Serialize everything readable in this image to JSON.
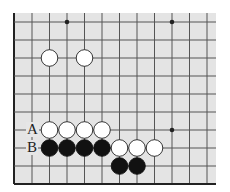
{
  "diagram": {
    "type": "go-board-fragment",
    "colors": {
      "board": "#e4e4e4",
      "line": "#555555",
      "edge": "#222222",
      "white_stone_fill": "#ffffff",
      "white_stone_stroke": "#222222",
      "black_stone": "#111111"
    },
    "grid": {
      "x_lines": [
        14,
        32,
        49.5,
        67,
        84.5,
        102,
        119.5,
        137,
        154.5,
        172,
        189.5,
        207
      ],
      "y_lines": [
        22,
        40,
        58,
        76,
        94,
        112,
        130,
        148,
        166,
        184
      ],
      "thick_edges": [
        "left",
        "bottom"
      ],
      "board_extent": {
        "x0": 14,
        "y0": 13,
        "x1": 216,
        "y1": 185
      }
    },
    "star_points": [
      {
        "x": 67,
        "y": 22
      },
      {
        "x": 172,
        "y": 22
      },
      {
        "x": 172,
        "y": 130
      }
    ],
    "stones": [
      {
        "color": "white",
        "x": 49.5,
        "y": 58
      },
      {
        "color": "white",
        "x": 84.5,
        "y": 58
      },
      {
        "color": "white",
        "x": 49.5,
        "y": 130
      },
      {
        "color": "white",
        "x": 67,
        "y": 130
      },
      {
        "color": "white",
        "x": 84.5,
        "y": 130
      },
      {
        "color": "white",
        "x": 102,
        "y": 130
      },
      {
        "color": "black",
        "x": 49.5,
        "y": 148
      },
      {
        "color": "black",
        "x": 67,
        "y": 148
      },
      {
        "color": "black",
        "x": 84.5,
        "y": 148
      },
      {
        "color": "black",
        "x": 102,
        "y": 148
      },
      {
        "color": "white",
        "x": 119.5,
        "y": 148
      },
      {
        "color": "white",
        "x": 137,
        "y": 148
      },
      {
        "color": "white",
        "x": 154.5,
        "y": 148
      },
      {
        "color": "black",
        "x": 119.5,
        "y": 166
      },
      {
        "color": "black",
        "x": 137,
        "y": 166
      }
    ],
    "labels": [
      {
        "text": "A",
        "x": 32,
        "y": 130
      },
      {
        "text": "B",
        "x": 32,
        "y": 148
      }
    ]
  }
}
